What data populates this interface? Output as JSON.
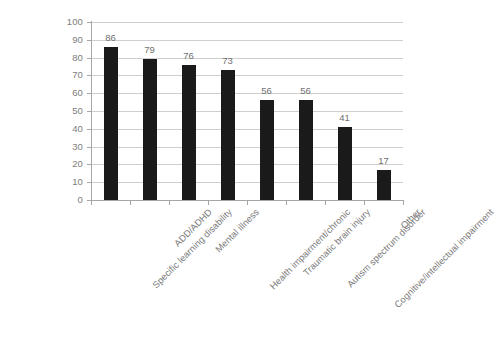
{
  "chart_data": {
    "type": "bar",
    "title": "",
    "subtitle": "",
    "xlabel": "",
    "ylabel": "",
    "ylim": [
      0,
      100
    ],
    "ytick_step": 10,
    "yticks": [
      0,
      10,
      20,
      30,
      40,
      50,
      60,
      70,
      80,
      90,
      100
    ],
    "grid": true,
    "grid_axis": "y",
    "legend": false,
    "legend_position": "none",
    "data_labels": true,
    "categories": [
      "Specific learning disability",
      "ADD/ADHD",
      "Mental illness",
      "Health impairment/chronic",
      "Traumatic brain injury",
      "Autism spectrum disorder",
      "Cognitive/intellectual impairment",
      "Other"
    ],
    "values": [
      86,
      79,
      76,
      73,
      56,
      56,
      41,
      17
    ],
    "series": [
      {
        "name": "",
        "values": [
          86,
          79,
          76,
          73,
          56,
          56,
          41,
          17
        ]
      }
    ],
    "colors": {
      "bar": "#1a1a1a",
      "gridline": "#cfcfcf",
      "axis": "#a6a6a6",
      "tick_label": "#7d7d7d",
      "data_label": "#6f6f6f",
      "category_label": "#7a7a7a",
      "background": "#ffffff"
    }
  }
}
